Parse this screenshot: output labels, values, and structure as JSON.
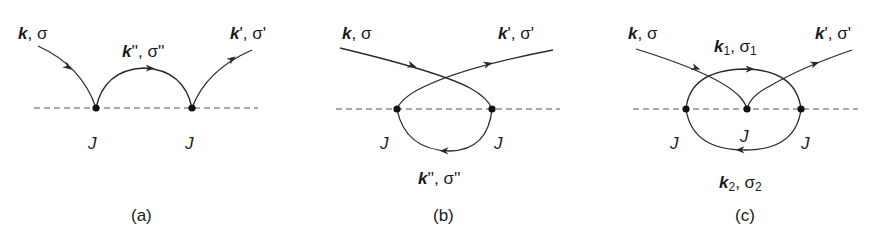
{
  "figure": {
    "panels": [
      {
        "id": "a",
        "caption": "(a)",
        "labels": {
          "incoming": {
            "momentum": "k",
            "spin": "σ"
          },
          "intermediate": {
            "momentum": "k",
            "prime": "''",
            "spin": "σ''"
          },
          "outgoing": {
            "momentum": "k",
            "prime": "'",
            "spin": "σ'"
          }
        },
        "vertices": [
          "J",
          "J"
        ]
      },
      {
        "id": "b",
        "caption": "(b)",
        "labels": {
          "incoming": {
            "momentum": "k",
            "spin": "σ"
          },
          "intermediate": {
            "momentum": "k",
            "prime": "''",
            "spin": "σ''"
          },
          "outgoing": {
            "momentum": "k",
            "prime": "'",
            "spin": "σ'"
          }
        },
        "vertices": [
          "J",
          "J"
        ]
      },
      {
        "id": "c",
        "caption": "(c)",
        "labels": {
          "incoming": {
            "momentum": "k",
            "spin": "σ"
          },
          "upper": {
            "momentum": "k",
            "sub": "1",
            "spin": "σ",
            "spin_sub": "1"
          },
          "lower": {
            "momentum": "k",
            "sub": "2",
            "spin": "σ",
            "spin_sub": "2"
          },
          "outgoing": {
            "momentum": "k",
            "prime": "'",
            "spin": "σ'"
          }
        },
        "vertices": [
          "J",
          "J",
          "J"
        ]
      }
    ],
    "colors": {
      "line": "#2a2a2a",
      "dash": "#555555",
      "text": "#1a1a1a"
    }
  }
}
